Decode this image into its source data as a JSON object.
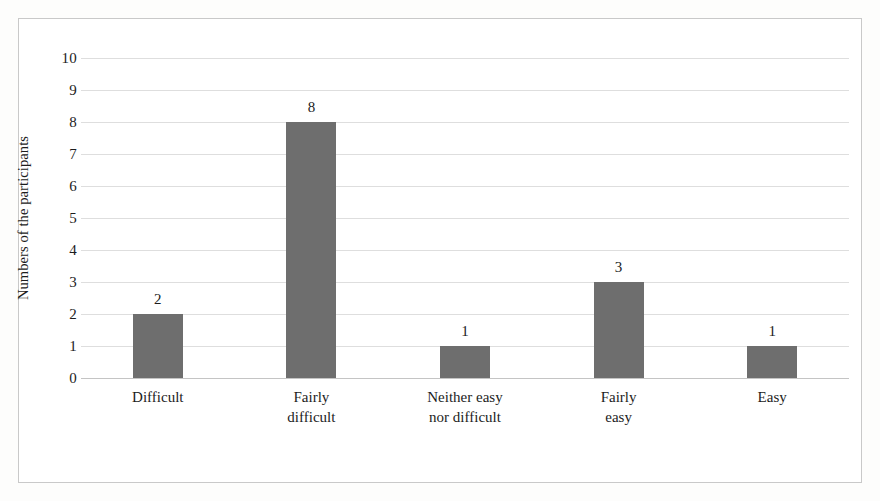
{
  "figure": {
    "background": "#ffffff",
    "frame_color": "#c9c9c9"
  },
  "axis": {
    "y_title": "Numbers of the participants",
    "y_ticks": [
      "10",
      "9",
      "8",
      "7",
      "6",
      "5",
      "4",
      "3",
      "2",
      "1",
      "0"
    ]
  },
  "bars": [
    {
      "label": "Difficult",
      "value_label": "2"
    },
    {
      "label": "Fairly\ndifficult",
      "value_label": "8"
    },
    {
      "label": "Neither easy\nnor difficult",
      "value_label": "1"
    },
    {
      "label": "Fairly\neasy",
      "value_label": "3"
    },
    {
      "label": "Easy",
      "value_label": "1"
    }
  ],
  "chart_data": {
    "type": "bar",
    "title": "",
    "subtitle": "",
    "xlabel": "",
    "ylabel": "Numbers of the participants",
    "categories": [
      "Difficult",
      "Fairly difficult",
      "Neither easy nor difficult",
      "Fairly easy",
      "Easy"
    ],
    "values": [
      2,
      8,
      1,
      3,
      1
    ],
    "data_labels": [
      "2",
      "8",
      "1",
      "3",
      "1"
    ],
    "ylim": [
      0,
      10
    ],
    "ytick_step": 1,
    "yticks": [
      0,
      1,
      2,
      3,
      4,
      5,
      6,
      7,
      8,
      9,
      10
    ],
    "grid": true,
    "grid_axis": "y",
    "legend": false,
    "legend_position": "none",
    "bar_color": "#6e6e6e",
    "gridline_color": "#dedede"
  }
}
